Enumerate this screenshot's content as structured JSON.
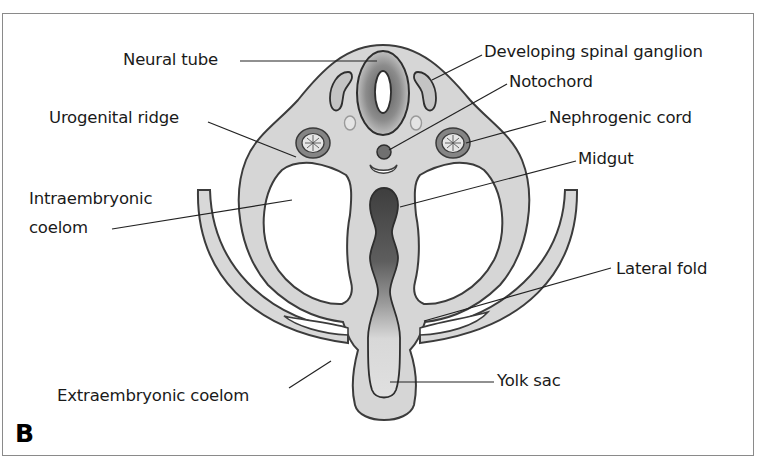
{
  "figure": {
    "panel_letter": "B",
    "colors": {
      "tissue_fill": "#d6d6d6",
      "outline": "#3c3c3c",
      "gut_dark": "#4a4a4a",
      "leader_line": "#222222",
      "frame": "#8a8a8a"
    }
  },
  "labels": {
    "neural_tube": "Neural tube",
    "developing_spinal_ganglion": "Developing spinal ganglion",
    "notochord": "Notochord",
    "urogenital_ridge": "Urogenital ridge",
    "nephrogenic_cord": "Nephrogenic cord",
    "midgut": "Midgut",
    "intraembryonic_coelom_line1": "Intraembryonic",
    "intraembryonic_coelom_line2": "coelom",
    "lateral_fold": "Lateral fold",
    "extraembryonic_coelom": "Extraembryonic coelom",
    "yolk_sac": "Yolk sac"
  }
}
